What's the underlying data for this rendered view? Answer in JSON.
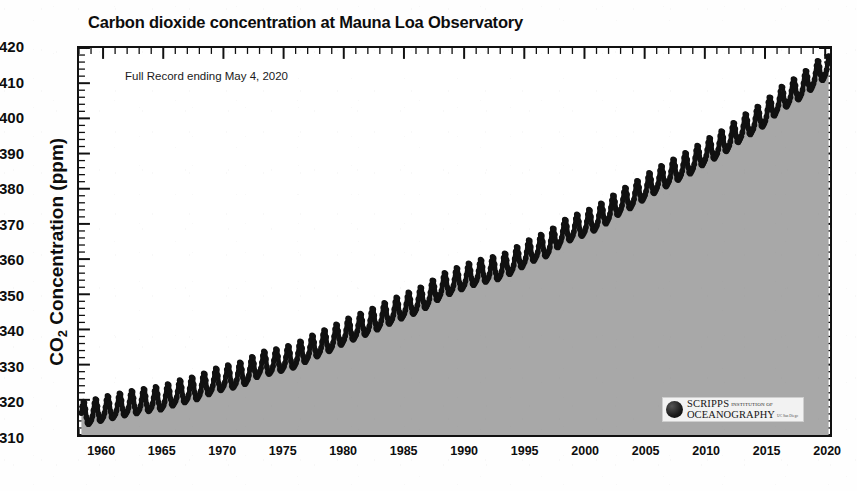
{
  "figure": {
    "title": "Carbon dioxide concentration at Mauna Loa Observatory",
    "annotation": "Full Record ending May 4, 2020",
    "y_axis_title_main": "CO",
    "y_axis_title_sub": "2",
    "y_axis_title_rest": " Concentration (ppm)"
  },
  "logo": {
    "icon": "globe-icon",
    "scripps": "SCRIPPS",
    "institution": "INSTITUTION OF",
    "oceanography": "OCEANOGRAPHY",
    "ucsd": "UC San Diego"
  },
  "colors": {
    "fill": "#a8a8a8",
    "line": "#111111",
    "frame": "#111111",
    "background": "#ffffff",
    "text": "#0d0d0d"
  },
  "chart_data": {
    "type": "line",
    "title": "Carbon dioxide concentration at Mauna Loa Observatory",
    "subtitle": "Full Record ending May 4, 2020",
    "xlabel": "",
    "ylabel": "CO2 Concentration (ppm)",
    "xlim": [
      1958.0,
      2020.4
    ],
    "ylim": [
      310,
      420
    ],
    "yticks": [
      310,
      320,
      330,
      340,
      350,
      360,
      370,
      380,
      390,
      400,
      410,
      420
    ],
    "xticks": [
      1960,
      1965,
      1970,
      1975,
      1980,
      1985,
      1990,
      1995,
      2000,
      2005,
      2010,
      2015,
      2020
    ],
    "x_minor_tick_interval": 1,
    "y_minor_tick_interval": 2,
    "grid": false,
    "legend": null,
    "fill_below": true,
    "seasonal_amplitude_ppm": 3.2,
    "seasonal_peak_month": "May",
    "seasonal_trough_month": "September",
    "series": [
      {
        "name": "Monthly mean CO2 (Keeling Curve)",
        "annual_mean_x": [
          1958,
          1959,
          1960,
          1961,
          1962,
          1963,
          1964,
          1965,
          1966,
          1967,
          1968,
          1969,
          1970,
          1971,
          1972,
          1973,
          1974,
          1975,
          1976,
          1977,
          1978,
          1979,
          1980,
          1981,
          1982,
          1983,
          1984,
          1985,
          1986,
          1987,
          1988,
          1989,
          1990,
          1991,
          1992,
          1993,
          1994,
          1995,
          1996,
          1997,
          1998,
          1999,
          2000,
          2001,
          2002,
          2003,
          2004,
          2005,
          2006,
          2007,
          2008,
          2009,
          2010,
          2011,
          2012,
          2013,
          2014,
          2015,
          2016,
          2017,
          2018,
          2019,
          2020
        ],
        "annual_mean_y": [
          315.3,
          315.98,
          316.91,
          317.64,
          318.45,
          318.99,
          319.62,
          320.04,
          321.38,
          322.16,
          323.04,
          324.62,
          325.68,
          326.32,
          327.45,
          329.68,
          330.18,
          331.11,
          332.04,
          333.83,
          335.4,
          336.84,
          338.75,
          340.11,
          341.45,
          343.05,
          344.65,
          346.12,
          347.42,
          349.19,
          351.57,
          353.12,
          354.39,
          355.61,
          356.45,
          357.1,
          358.83,
          360.82,
          362.61,
          363.73,
          366.7,
          368.38,
          369.55,
          371.14,
          373.28,
          375.8,
          377.52,
          379.8,
          381.9,
          383.79,
          385.6,
          387.43,
          389.9,
          391.65,
          393.85,
          396.52,
          398.65,
          400.83,
          404.24,
          406.55,
          408.52,
          411.44,
          414.2
        ],
        "units": "ppm",
        "first_value": 315.3,
        "last_value": 417.3,
        "last_date": "May 4, 2020"
      }
    ]
  },
  "y_ticks": [
    {
      "value": 420
    },
    {
      "value": 410
    },
    {
      "value": 400
    },
    {
      "value": 390
    },
    {
      "value": 380
    },
    {
      "value": 370
    },
    {
      "value": 360
    },
    {
      "value": 350
    },
    {
      "value": 340
    },
    {
      "value": 330
    },
    {
      "value": 320
    },
    {
      "value": 310
    }
  ],
  "x_ticks": [
    {
      "value": 1960
    },
    {
      "value": 1965
    },
    {
      "value": 1970
    },
    {
      "value": 1975
    },
    {
      "value": 1980
    },
    {
      "value": 1985
    },
    {
      "value": 1990
    },
    {
      "value": 1995
    },
    {
      "value": 2000
    },
    {
      "value": 2005
    },
    {
      "value": 2010
    },
    {
      "value": 2015
    },
    {
      "value": 2020
    }
  ]
}
